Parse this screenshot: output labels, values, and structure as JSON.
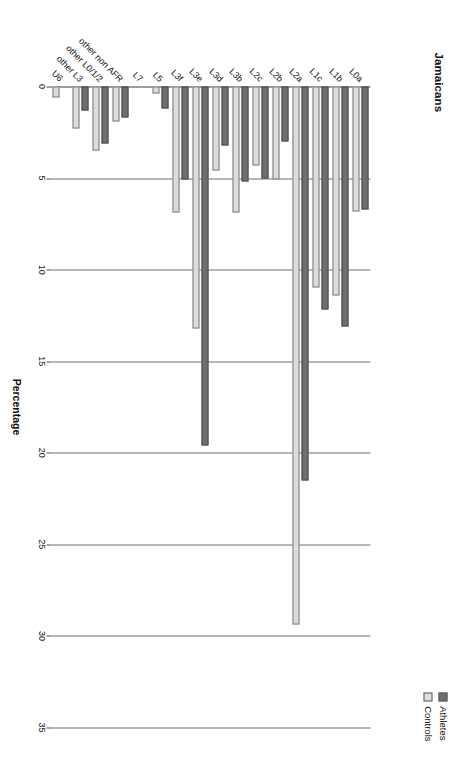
{
  "chart_data": {
    "type": "bar",
    "orientation": "vertical",
    "title": "Jamaicans",
    "xlabel": "",
    "ylabel": "Percentage",
    "ylim": [
      0,
      35
    ],
    "yticks": [
      0,
      5,
      10,
      15,
      20,
      25,
      30,
      35
    ],
    "grid": true,
    "legend_position": "top-right",
    "categories": [
      "L0a",
      "L1b",
      "L1c",
      "L2a",
      "L2b",
      "L2c",
      "L3b",
      "L3d",
      "L3e",
      "L3f",
      "L5",
      "L7",
      "other non AFR",
      "other L0/1/2",
      "other L3",
      "U6"
    ],
    "series": [
      {
        "name": "Athletes",
        "color": "#6e6e6e",
        "values": [
          6.7,
          13.1,
          12.2,
          21.5,
          3.0,
          5.0,
          5.2,
          3.2,
          19.6,
          5.1,
          1.2,
          0.0,
          1.7,
          3.1,
          1.3,
          0.0
        ]
      },
      {
        "name": "Controls",
        "color": "#dcdcdc",
        "values": [
          6.8,
          11.4,
          11.0,
          29.4,
          5.1,
          4.3,
          6.9,
          4.6,
          13.2,
          6.9,
          0.4,
          0.0,
          1.9,
          3.5,
          2.3,
          0.6
        ]
      }
    ]
  },
  "legend": {
    "items": [
      {
        "label": "Athletes",
        "color": "#6e6e6e"
      },
      {
        "label": "Controls",
        "color": "#dcdcdc"
      }
    ]
  }
}
